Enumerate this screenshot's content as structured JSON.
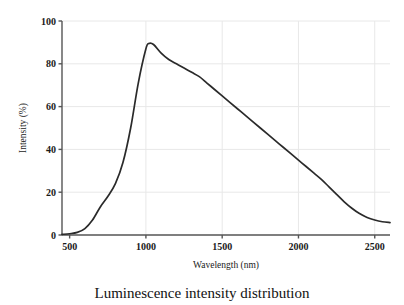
{
  "figure": {
    "caption": "Luminescence intensity distribution",
    "background_color": "#ffffff",
    "line_color": "#2a2a2a",
    "grid_color": "#e8e8e8",
    "axis_color": "#555555"
  },
  "chart_data": {
    "type": "line",
    "title": "",
    "caption": "Luminescence intensity distribution",
    "xlabel": "Wavelength (nm)",
    "ylabel": "Intensity (%)",
    "xlim": [
      450,
      2600
    ],
    "ylim": [
      0,
      100
    ],
    "xticks": [
      500,
      1000,
      1500,
      2000,
      2500
    ],
    "xtick_labels": [
      "500",
      "1000",
      "1500",
      "2000",
      "2500"
    ],
    "yticks": [
      0,
      20,
      40,
      60,
      80,
      100
    ],
    "ytick_labels": [
      "0",
      "20",
      "40",
      "60",
      "80",
      "100"
    ],
    "grid": true,
    "legend": null,
    "series": [
      {
        "name": "Luminescence intensity",
        "color": "#2a2a2a",
        "x": [
          450,
          500,
          550,
          600,
          650,
          700,
          750,
          800,
          850,
          900,
          950,
          1000,
          1020,
          1050,
          1100,
          1150,
          1200,
          1250,
          1300,
          1350,
          1400,
          1450,
          1500,
          1550,
          1600,
          1650,
          1700,
          1750,
          1800,
          1850,
          1900,
          1950,
          2000,
          2050,
          2100,
          2150,
          2200,
          2250,
          2300,
          2350,
          2400,
          2450,
          2500,
          2550,
          2600
        ],
        "y": [
          0.3,
          0.6,
          1.2,
          3.0,
          7.0,
          13.0,
          18.0,
          24.0,
          34.0,
          50.0,
          71.0,
          87.0,
          89.5,
          89.0,
          85.0,
          82.0,
          80.0,
          78.0,
          76.0,
          74.0,
          71.0,
          68.0,
          65.0,
          62.0,
          59.0,
          56.0,
          53.0,
          50.0,
          47.0,
          44.0,
          41.0,
          38.0,
          35.0,
          32.0,
          29.0,
          26.0,
          22.5,
          19.0,
          15.5,
          12.5,
          10.0,
          8.2,
          7.0,
          6.2,
          5.8
        ]
      }
    ]
  }
}
